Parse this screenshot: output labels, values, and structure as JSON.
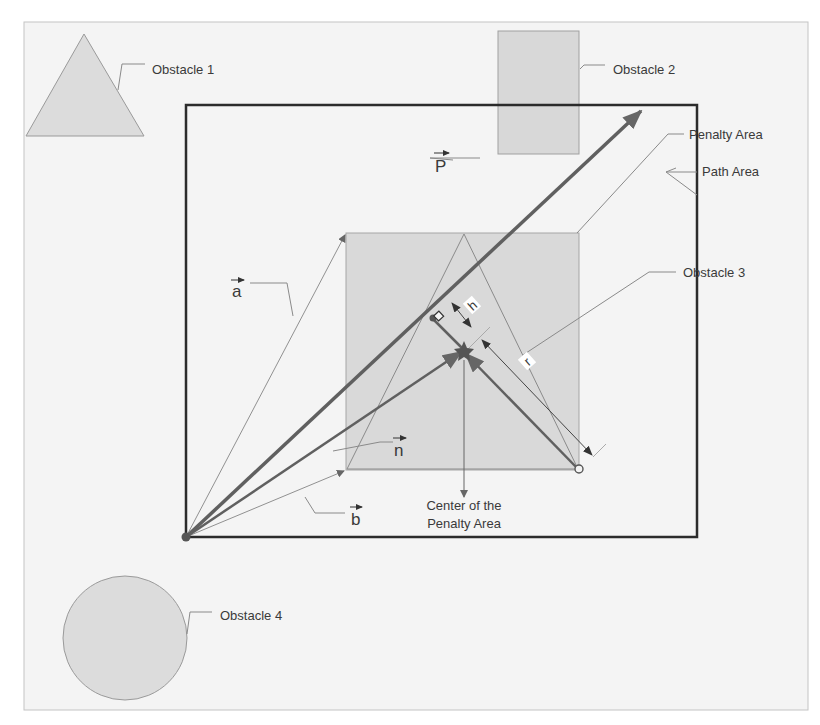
{
  "diagram": {
    "title": "",
    "colors": {
      "background": "#f4f4f4",
      "frame": "#bdbdbd",
      "obstacle_fill": "#dcdcdc",
      "obstacle_stroke": "#9a9a9a",
      "penalty_fill": "#d9d9d9",
      "main_border": "#2b2b2b",
      "vector_dark": "#595959",
      "vector_light": "#8c8c8c",
      "leader": "#7a7a7a"
    },
    "labels": {
      "obstacle_1": "Obstacle 1",
      "obstacle_2": "Obstacle 2",
      "obstacle_3": "Obstacle 3",
      "obstacle_4": "Obstacle 4",
      "penalty_area": "Penalty Area",
      "path_area": "Path Area",
      "center_line1": "Center of the",
      "center_line2": "Penalty Area"
    },
    "vectors": {
      "P": "P",
      "a": "a",
      "b": "b",
      "n": "n",
      "h": "h",
      "r": "r"
    }
  }
}
